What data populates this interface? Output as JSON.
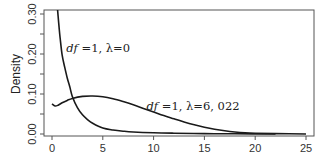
{
  "chart_data": {
    "type": "line",
    "title": "",
    "xlabel": "",
    "ylabel": "Density",
    "xlim": [
      -0.8,
      25.8
    ],
    "ylim": [
      -0.01,
      0.31
    ],
    "xticks": [
      0,
      5,
      10,
      15,
      20,
      25
    ],
    "xtick_labels": [
      "0",
      "5",
      "10",
      "15",
      "20",
      "25"
    ],
    "yticks": [
      0.0,
      0.05,
      0.1,
      0.15,
      0.2,
      0.25,
      0.3
    ],
    "ytick_labels": [
      "0.00",
      "",
      "0.10",
      "",
      "0.20",
      "",
      "0.30"
    ],
    "grid": false,
    "legend": "none",
    "series": [
      {
        "name": "df=1, λ=0",
        "x": [
          0.55,
          0.6,
          0.7,
          0.8,
          1.0,
          1.25,
          1.5,
          1.75,
          2.0,
          2.5,
          3.0,
          3.5,
          4.0,
          5.0,
          6.0,
          7.0,
          8.0,
          10.0,
          12.0,
          15.0,
          18.0,
          22.0
        ],
        "y": [
          0.31,
          0.295,
          0.266,
          0.24,
          0.197,
          0.167,
          0.14,
          0.118,
          0.094,
          0.066,
          0.048,
          0.036,
          0.027,
          0.015,
          0.01,
          0.007,
          0.005,
          0.003,
          0.002,
          0.001,
          0.0005,
          0.0
        ]
      },
      {
        "name": "df=1, λ=6,022",
        "x": [
          0.0,
          0.3,
          0.6,
          1.0,
          1.5,
          2.0,
          3.0,
          4.0,
          5.0,
          6.0,
          7.0,
          8.0,
          9.0,
          10.0,
          11.0,
          12.0,
          13.0,
          14.0,
          15.0,
          16.0,
          17.0,
          18.0,
          19.0,
          20.0,
          22.0,
          25.0
        ],
        "y": [
          0.075,
          0.07,
          0.072,
          0.078,
          0.084,
          0.089,
          0.094,
          0.095,
          0.093,
          0.088,
          0.081,
          0.073,
          0.064,
          0.055,
          0.046,
          0.038,
          0.03,
          0.023,
          0.017,
          0.012,
          0.008,
          0.005,
          0.003,
          0.002,
          0.001,
          0.0
        ]
      }
    ],
    "annotations": [
      {
        "label_italic": "df",
        "label_rest": " =1,  λ=0",
        "x": 1.4,
        "y": 0.205
      },
      {
        "label_italic": "df",
        "label_rest": " =1,  λ=6, 022",
        "x": 9.3,
        "y": 0.059
      }
    ]
  }
}
